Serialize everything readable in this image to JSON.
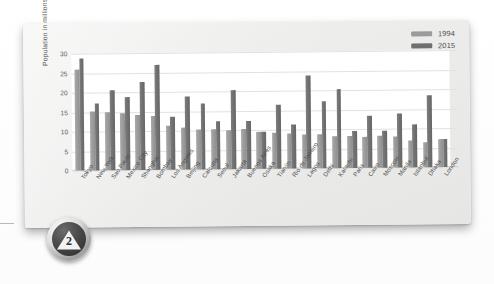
{
  "badge": {
    "number": "2",
    "icon": "triangle-badge"
  },
  "legend": {
    "position": "top-right",
    "entries": [
      {
        "label": "1994",
        "color": "#9b9b9b"
      },
      {
        "label": "2015",
        "color": "#6f6f6f"
      }
    ]
  },
  "chart_data": {
    "type": "bar",
    "title": "",
    "xlabel": "",
    "ylabel": "Population in millions",
    "ylim": [
      0,
      30
    ],
    "yticks": [
      0,
      5,
      10,
      15,
      20,
      25,
      30
    ],
    "grid": true,
    "legend_position": "top-right",
    "categories": [
      "Tokyo",
      "New York",
      "Sao Paulo",
      "Mexico City",
      "Shanghai",
      "Bombay",
      "Los Angeles",
      "Beijing",
      "Calcutta",
      "Seoul",
      "Jakarta",
      "Buenos Aires",
      "Osaka",
      "Tianjin",
      "Rio de Janeiro",
      "Lagos",
      "Delhi",
      "Karachi",
      "Paris",
      "Cairo",
      "Moscow",
      "Manila",
      "Istanbul",
      "Dhaka",
      "London"
    ],
    "series": [
      {
        "name": "1994",
        "color": "#9b9b9b",
        "values": [
          25.8,
          15.1,
          15.0,
          14.6,
          14.0,
          13.9,
          11.2,
          10.8,
          10.3,
          10.2,
          10.0,
          10.2,
          9.5,
          9.3,
          8.9,
          8.7,
          8.6,
          8.2,
          8.3,
          8.0,
          8.1,
          8.0,
          7.0,
          6.5,
          7.1
        ]
      },
      {
        "name": "2015",
        "color": "#6f6f6f",
        "values": [
          28.7,
          17.2,
          20.5,
          18.7,
          22.6,
          27.0,
          13.6,
          18.7,
          16.8,
          12.3,
          20.2,
          12.4,
          9.5,
          16.4,
          11.4,
          23.8,
          17.3,
          20.2,
          9.4,
          13.4,
          9.4,
          13.9,
          11.0,
          18.4,
          7.2
        ]
      }
    ]
  }
}
